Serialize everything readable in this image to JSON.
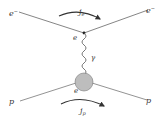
{
  "diagram": {
    "type": "feynman",
    "labels": {
      "electron_in": "e",
      "electron_in_sup": "−",
      "electron_out": "e",
      "electron_out_sup": "−",
      "electron_current": "j",
      "electron_current_sub": "e",
      "electron_vertex_charge": "e",
      "photon": "γ",
      "proton_vertex_charge": "e",
      "proton_in": "p",
      "proton_out": "p",
      "proton_current": "j",
      "proton_current_sub": "p"
    },
    "colors": {
      "line": "#555555",
      "blob_fill": "#bdbdbd",
      "blob_stroke": "#666666"
    }
  }
}
